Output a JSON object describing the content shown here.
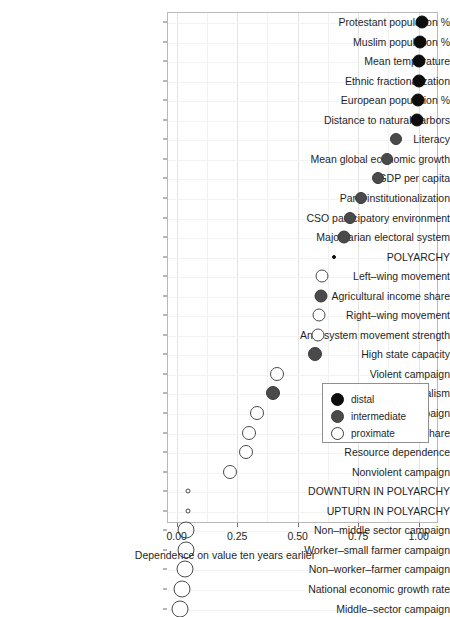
{
  "chart_data": {
    "type": "scatter",
    "title": "",
    "xlabel": "Dependence on value ten years earlier",
    "ylabel": "",
    "xlim": [
      -0.04,
      1.08
    ],
    "xticks": [
      0.0,
      0.25,
      0.5,
      0.75,
      1.0
    ],
    "xtick_labels": [
      "0.00",
      "0.25",
      "0.50",
      "0.75",
      "1.00"
    ],
    "grid": true,
    "legend_position": "bottom-right",
    "legend": [
      {
        "label": "distal",
        "color": "#0d0d0d",
        "fill": "solid"
      },
      {
        "label": "intermediate",
        "color": "#4a4a4a",
        "fill": "solid"
      },
      {
        "label": "proximate",
        "color": "#ffffff",
        "fill": "open"
      }
    ],
    "categories": [
      "Protestant population %",
      "Muslim population %",
      "Mean temperature",
      "Ethnic fractionalization",
      "European population %",
      "Distance to natural harbors",
      "Literacy",
      "Mean global economic growth",
      "GDP per capita",
      "Party institutionalization",
      "CSO participatory environment",
      "Majoritarian electoral system",
      "POLYARCHY",
      "Left–wing movement",
      "Agricultural income share",
      "Right–wing movement",
      "Anti–system movement strength",
      "High state capacity",
      "Violent campaign",
      "Strict presidentialism",
      "Ongoing campaign",
      "Largest seat share",
      "Resource dependence",
      "Nonviolent campaign",
      "DOWNTURN IN POLYARCHY",
      "UPTURN IN POLYARCHY",
      "Non–middle sector campaign",
      "Worker–small farmer campaign",
      "Non–worker–farmer campaign",
      "National economic growth rate",
      "Middle–sector campaign"
    ],
    "points": [
      {
        "label": "Protestant population %",
        "value": 1.015,
        "group": "distal",
        "size": 13
      },
      {
        "label": "Muslim population %",
        "value": 1.005,
        "group": "distal",
        "size": 13
      },
      {
        "label": "Mean temperature",
        "value": 1.002,
        "group": "distal",
        "size": 13
      },
      {
        "label": "Ethnic fractionalization",
        "value": 1.0,
        "group": "distal",
        "size": 13
      },
      {
        "label": "European population %",
        "value": 0.998,
        "group": "distal",
        "size": 13
      },
      {
        "label": "Distance to natural harbors",
        "value": 0.995,
        "group": "distal",
        "size": 13
      },
      {
        "label": "Literacy",
        "value": 0.905,
        "group": "intermediate",
        "size": 12
      },
      {
        "label": "Mean global economic growth",
        "value": 0.868,
        "group": "intermediate",
        "size": 12
      },
      {
        "label": "GDP per capita",
        "value": 0.83,
        "group": "intermediate",
        "size": 12
      },
      {
        "label": "Party institutionalization",
        "value": 0.76,
        "group": "intermediate",
        "size": 12
      },
      {
        "label": "CSO participatory environment",
        "value": 0.715,
        "group": "intermediate",
        "size": 12
      },
      {
        "label": "Majoritarian electoral system",
        "value": 0.692,
        "group": "intermediate",
        "size": 13
      },
      {
        "label": "POLYARCHY",
        "value": 0.65,
        "group": "distal",
        "size": 4
      },
      {
        "label": "Left–wing movement",
        "value": 0.6,
        "group": "proximate",
        "size": 13
      },
      {
        "label": "Agricultural income share",
        "value": 0.598,
        "group": "intermediate",
        "size": 13
      },
      {
        "label": "Right–wing movement",
        "value": 0.588,
        "group": "proximate",
        "size": 13
      },
      {
        "label": "Anti–system movement strength",
        "value": 0.585,
        "group": "proximate",
        "size": 13
      },
      {
        "label": "High state capacity",
        "value": 0.57,
        "group": "intermediate",
        "size": 14
      },
      {
        "label": "Violent campaign",
        "value": 0.415,
        "group": "proximate",
        "size": 14
      },
      {
        "label": "Strict presidentialism",
        "value": 0.398,
        "group": "intermediate",
        "size": 14
      },
      {
        "label": "Ongoing campaign",
        "value": 0.33,
        "group": "proximate",
        "size": 14
      },
      {
        "label": "Largest seat share",
        "value": 0.3,
        "group": "proximate",
        "size": 14
      },
      {
        "label": "Resource dependence",
        "value": 0.288,
        "group": "proximate",
        "size": 14
      },
      {
        "label": "Nonviolent campaign",
        "value": 0.222,
        "group": "proximate",
        "size": 14
      },
      {
        "label": "DOWNTURN IN POLYARCHY",
        "value": 0.045,
        "group": "proximate",
        "size": 5
      },
      {
        "label": "UPTURN IN POLYARCHY",
        "value": 0.045,
        "group": "proximate",
        "size": 5
      },
      {
        "label": "Non–middle sector campaign",
        "value": 0.04,
        "group": "proximate",
        "size": 17
      },
      {
        "label": "Worker–small farmer campaign",
        "value": 0.038,
        "group": "proximate",
        "size": 17
      },
      {
        "label": "Non–worker–farmer campaign",
        "value": 0.035,
        "group": "proximate",
        "size": 17
      },
      {
        "label": "National economic growth rate",
        "value": 0.022,
        "group": "proximate",
        "size": 17
      },
      {
        "label": "Middle–sector campaign",
        "value": 0.012,
        "group": "proximate",
        "size": 17
      }
    ]
  }
}
